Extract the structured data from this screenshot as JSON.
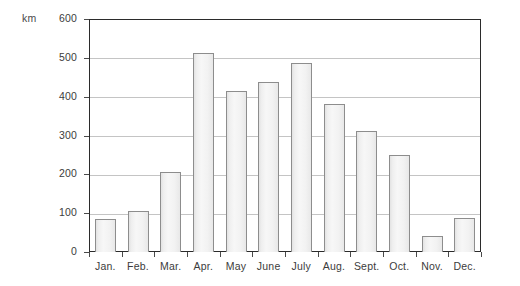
{
  "chart_data": {
    "type": "bar",
    "title": "",
    "xlabel": "",
    "ylabel": "km",
    "unit_label": "km",
    "categories": [
      "Jan.",
      "Feb.",
      "Mar.",
      "Apr.",
      "May",
      "June",
      "July",
      "Aug.",
      "Sept.",
      "Oct.",
      "Nov.",
      "Dec."
    ],
    "values": [
      85,
      105,
      207,
      512,
      414,
      438,
      486,
      381,
      312,
      251,
      42,
      87
    ],
    "ylim": [
      0,
      600
    ],
    "yticks": [
      0,
      100,
      200,
      300,
      400,
      500,
      600
    ],
    "ytick_labels": [
      "0",
      "100",
      "200",
      "300",
      "400",
      "500",
      "600"
    ],
    "grid": true,
    "legend": "none",
    "colors": {
      "bar_fill": "#f2f2f2",
      "bar_edge": "#8d8d8d",
      "frame": "#2b2b2b",
      "gridline": "#c4c4c4",
      "text": "#3c3c3c",
      "background": "#ffffff"
    }
  }
}
